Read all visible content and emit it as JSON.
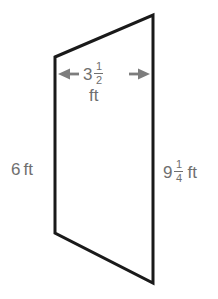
{
  "figure": {
    "type": "quadrilateral-trapezoid",
    "shape_color": "#1a1a1a",
    "label_color": "#6f6f6f",
    "arrow_color": "#7a7a7a",
    "background_color": "#ffffff",
    "vertices": [
      {
        "name": "top-left",
        "x": 55,
        "y": 57
      },
      {
        "name": "top-right",
        "x": 153,
        "y": 15
      },
      {
        "name": "bottom-right",
        "x": 153,
        "y": 283
      },
      {
        "name": "bottom-left",
        "x": 55,
        "y": 233
      }
    ],
    "labels": {
      "top": {
        "whole": "3",
        "numerator": "1",
        "denominator": "2",
        "unit": "ft",
        "full_text": "3 1/2 ft"
      },
      "left": {
        "whole": "6",
        "unit": "ft",
        "full_text": "6 ft"
      },
      "right": {
        "whole": "9",
        "numerator": "1",
        "denominator": "4",
        "unit": "ft",
        "full_text": "9 1/4 ft"
      }
    },
    "arrows": {
      "name": "double-headed-width-arrow",
      "left_arrow": "arrow-left-icon",
      "right_arrow": "arrow-right-icon"
    }
  }
}
